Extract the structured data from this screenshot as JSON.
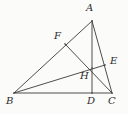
{
  "figure": {
    "background_color": "#fbfbf9",
    "stroke_color": "#3a3a3a",
    "label_color": "#2b2b2b",
    "width": 128,
    "height": 114,
    "points": {
      "A": {
        "label": "A",
        "x": 92,
        "y": 21,
        "label_x": 86,
        "label_y": 3
      },
      "B": {
        "label": "B",
        "x": 14,
        "y": 93,
        "label_x": 6,
        "label_y": 96
      },
      "C": {
        "label": "C",
        "x": 112,
        "y": 93,
        "label_x": 108,
        "label_y": 96
      },
      "D": {
        "label": "D",
        "x": 92,
        "y": 93,
        "label_x": 87,
        "label_y": 96
      },
      "E": {
        "label": "E",
        "x": 105,
        "y": 65,
        "label_x": 110,
        "label_y": 56
      },
      "F": {
        "label": "F",
        "x": 65,
        "y": 44,
        "label_x": 54,
        "label_y": 31
      },
      "H": {
        "label": "H",
        "x": 92,
        "y": 68,
        "label_x": 80,
        "label_y": 71
      }
    },
    "segments": [
      {
        "name": "side-AB",
        "from": "A",
        "to": "B"
      },
      {
        "name": "side-BC",
        "from": "B",
        "to": "C"
      },
      {
        "name": "side-CA",
        "from": "C",
        "to": "A"
      },
      {
        "name": "altitude-AD",
        "from": "A",
        "to": "D"
      },
      {
        "name": "altitude-BE",
        "from": "B",
        "to": "E"
      },
      {
        "name": "altitude-CF",
        "from": "C",
        "to": "F"
      }
    ]
  },
  "chart_data": {
    "type": "diagram",
    "vertices": [
      {
        "id": "A",
        "x": 92,
        "y": 21
      },
      {
        "id": "B",
        "x": 14,
        "y": 93
      },
      {
        "id": "C",
        "x": 112,
        "y": 93
      }
    ],
    "feet_of_altitudes": [
      {
        "id": "D",
        "on_side": "BC",
        "from_vertex": "A",
        "x": 92,
        "y": 93
      },
      {
        "id": "E",
        "on_side": "CA",
        "from_vertex": "B",
        "x": 105,
        "y": 65
      },
      {
        "id": "F",
        "on_side": "AB",
        "from_vertex": "C",
        "x": 65,
        "y": 44
      }
    ],
    "intersection": {
      "id": "H",
      "name": "orthocenter",
      "x": 92,
      "y": 68
    },
    "labels": [
      "A",
      "B",
      "C",
      "D",
      "E",
      "F",
      "H"
    ],
    "edges": [
      "AB",
      "BC",
      "CA",
      "AD",
      "BE",
      "CF"
    ]
  }
}
